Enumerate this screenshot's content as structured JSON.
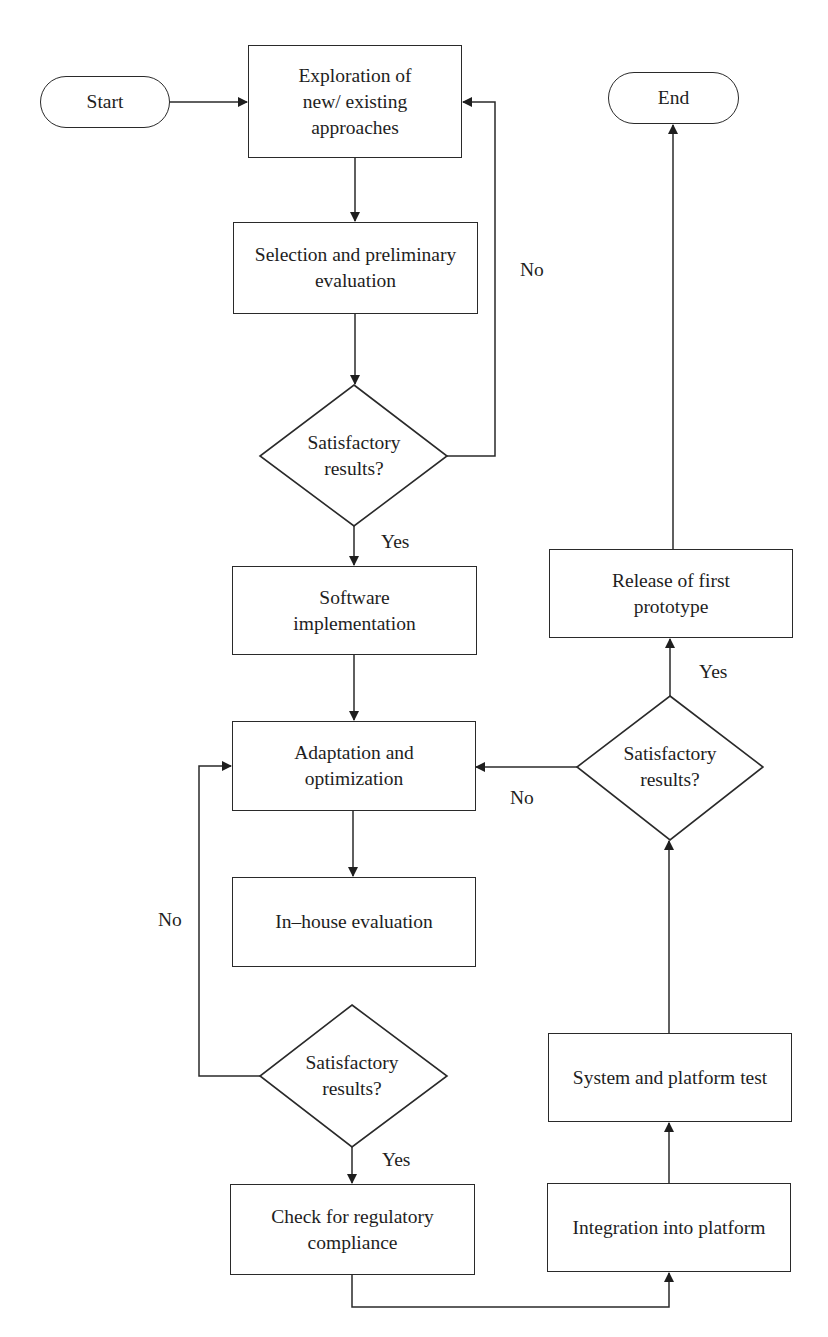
{
  "diagram": {
    "type": "flowchart",
    "nodes": {
      "start": {
        "label": "Start",
        "shape": "terminal"
      },
      "exploration": {
        "label": "Exploration of new/ existing approaches",
        "shape": "process"
      },
      "selection": {
        "label": "Selection and preliminary evaluation",
        "shape": "process"
      },
      "decision1": {
        "label": "Satisfactory results?",
        "shape": "decision"
      },
      "software": {
        "label": "Software implementation",
        "shape": "process"
      },
      "adaptation": {
        "label": "Adaptation and optimization",
        "shape": "process"
      },
      "inhouse": {
        "label": "In–house evaluation",
        "shape": "process"
      },
      "decision2": {
        "label": "Satisfactory results?",
        "shape": "decision"
      },
      "regulatory": {
        "label": "Check for regulatory compliance",
        "shape": "process"
      },
      "integration": {
        "label": "Integration into platform",
        "shape": "process"
      },
      "systemtest": {
        "label": "System and platform test",
        "shape": "process"
      },
      "decision3": {
        "label": "Satisfactory results?",
        "shape": "decision"
      },
      "release": {
        "label": "Release of first prototype",
        "shape": "process"
      },
      "end": {
        "label": "End",
        "shape": "terminal"
      }
    },
    "edge_labels": {
      "d1_no": "No",
      "d1_yes": "Yes",
      "d2_no": "No",
      "d2_yes": "Yes",
      "d3_no": "No",
      "d3_yes": "Yes"
    },
    "edges": [
      {
        "from": "start",
        "to": "exploration"
      },
      {
        "from": "exploration",
        "to": "selection"
      },
      {
        "from": "selection",
        "to": "decision1"
      },
      {
        "from": "decision1",
        "to": "exploration",
        "label": "No"
      },
      {
        "from": "decision1",
        "to": "software",
        "label": "Yes"
      },
      {
        "from": "software",
        "to": "adaptation"
      },
      {
        "from": "adaptation",
        "to": "inhouse"
      },
      {
        "from": "decision2",
        "to": "adaptation",
        "label": "No"
      },
      {
        "from": "decision2",
        "to": "regulatory",
        "label": "Yes"
      },
      {
        "from": "regulatory",
        "to": "integration"
      },
      {
        "from": "integration",
        "to": "systemtest"
      },
      {
        "from": "systemtest",
        "to": "decision3"
      },
      {
        "from": "decision3",
        "to": "adaptation",
        "label": "No"
      },
      {
        "from": "decision3",
        "to": "release",
        "label": "Yes"
      },
      {
        "from": "release",
        "to": "end"
      }
    ],
    "colors": {
      "stroke": "#2a2a2a",
      "text": "#1e1e1e",
      "background": "#ffffff"
    }
  }
}
